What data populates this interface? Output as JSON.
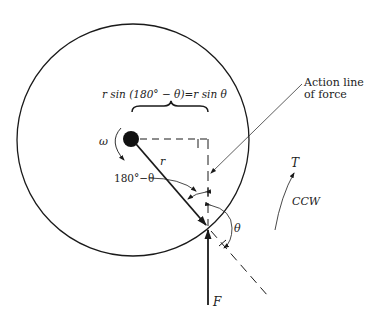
{
  "diagram": {
    "labels": {
      "moment_arm": "r sin (180° − θ)=r sin  θ",
      "omega": "ω",
      "radius": "r",
      "supplement_angle": "180°−θ",
      "theta": "θ",
      "force": "F",
      "torque": "T",
      "direction": "CCW",
      "action_line_1": "Action line",
      "action_line_2": "of force"
    },
    "colors": {
      "stroke": "#1a1a1a",
      "background": "#ffffff"
    },
    "geometry": {
      "circle": {
        "cx": 133,
        "cy": 140,
        "r": 116
      },
      "pivot": {
        "cx": 131,
        "cy": 139,
        "r": 8
      },
      "contact_point": {
        "x": 208,
        "y": 227
      }
    }
  }
}
